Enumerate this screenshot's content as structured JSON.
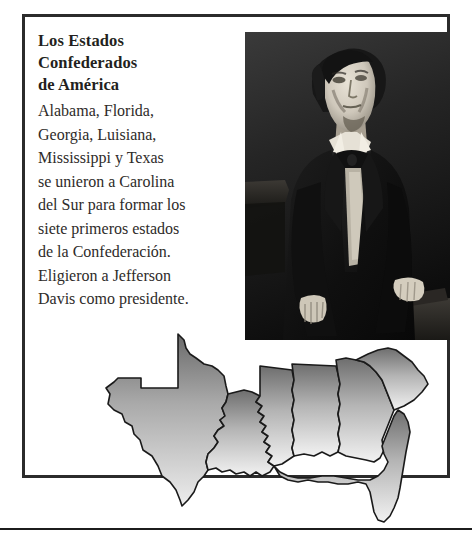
{
  "page": {
    "background_color": "#ffffff",
    "frame_color": "#2b2b2b",
    "rule_color": "#1c1c1c"
  },
  "article": {
    "title_lines": [
      "Los Estados",
      "Confederados",
      "de América"
    ],
    "body_lines": [
      "Alabama, Florida,",
      "Georgia, Luisiana,",
      "Mississippi y Texas",
      "se unieron a Carolina",
      "del Sur para formar los",
      "siete primeros estados",
      "de la Confederación.",
      "Eligieron a Jefferson",
      "Davis como presidente."
    ]
  },
  "photo": {
    "name": "jefferson-davis-portrait",
    "description": "Retrato en blanco y negro de Jefferson Davis de pie junto a una mesa",
    "tone_dark": "#111111",
    "tone_light": "#d8d4cc"
  },
  "map": {
    "name": "confederate-states-map",
    "description": "Mapa de los siete primeros estados confederados",
    "fill_top": "#6f6f6f",
    "fill_bottom": "#efefef",
    "stroke": "#1a1a1a",
    "states": [
      "Texas",
      "Luisiana",
      "Mississippi",
      "Alabama",
      "Georgia",
      "Carolina del Sur",
      "Florida"
    ]
  }
}
